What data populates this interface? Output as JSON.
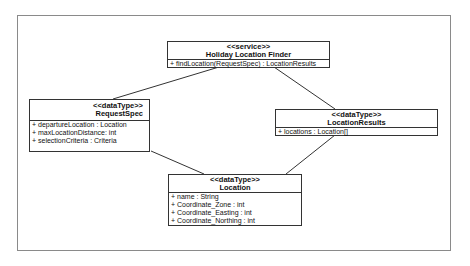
{
  "diagram": {
    "type": "uml-class-diagram",
    "frame_color": "#8a8a8a",
    "line_color": "#333333",
    "classes": [
      {
        "id": "holiday-location-finder",
        "stereotype": "<<service>>",
        "name": "Holiday Location Finder",
        "members": [
          "+ findLocation(RequestSpec) : LocationResults"
        ]
      },
      {
        "id": "request-spec",
        "stereotype": "<<dataType>>",
        "name": "RequestSpec",
        "members": [
          "+ departureLocation : Location",
          "+ maxLocationDistance: int",
          "+ selectionCriteria : Criteria"
        ]
      },
      {
        "id": "location-results",
        "stereotype": "<<dataType>>",
        "name": "LocationResults",
        "members": [
          "+ locations : Location[]"
        ]
      },
      {
        "id": "location",
        "stereotype": "<<dataType>>",
        "name": "Location",
        "members": [
          "+ name : String",
          "+ Coordinate_Zone : int",
          "+ Coordinate_Easting : int",
          "+ Coordinate_Northing : int"
        ]
      }
    ],
    "associations": [
      {
        "from": "Holiday Location Finder",
        "to": "RequestSpec"
      },
      {
        "from": "Holiday Location Finder",
        "to": "LocationResults"
      },
      {
        "from": "RequestSpec",
        "to": "Location"
      },
      {
        "from": "LocationResults",
        "to": "Location"
      }
    ]
  }
}
